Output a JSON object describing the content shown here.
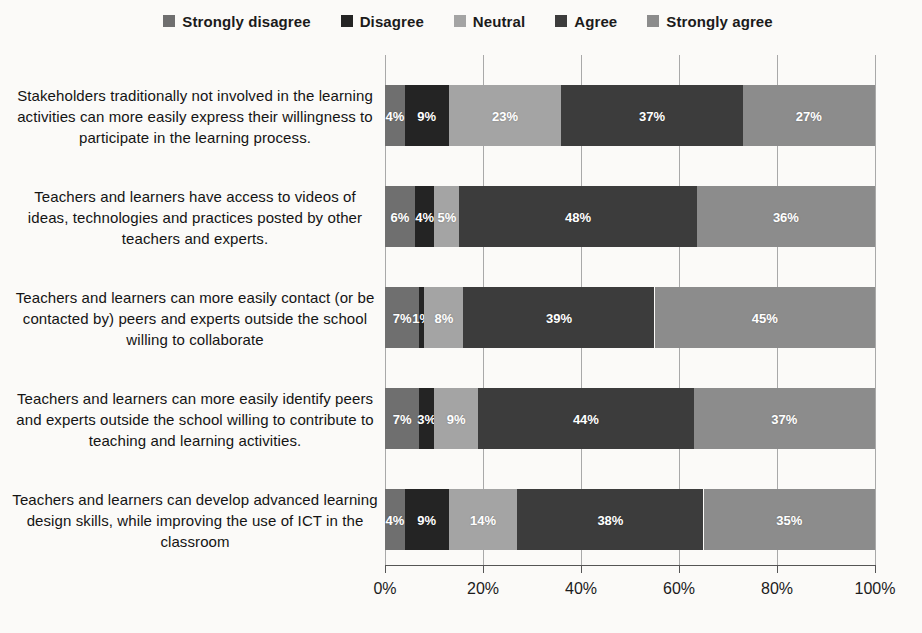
{
  "page": {
    "background": "#fbfaf8"
  },
  "chart_data": {
    "type": "bar",
    "orientation": "horizontal",
    "stacked_percent": true,
    "title": "",
    "legend_position": "top",
    "grid": true,
    "xlim": [
      0,
      100
    ],
    "x_ticks": [
      "0%",
      "20%",
      "40%",
      "60%",
      "80%",
      "100%"
    ],
    "x_tick_values": [
      0,
      20,
      40,
      60,
      80,
      100
    ],
    "categories": [
      "Stakeholders traditionally not involved in the learning activities can more easily express their willingness to participate in the learning process.",
      "Teachers and learners have access to videos of ideas, technologies and practices posted by other teachers and experts.",
      "Teachers and learners can more easily contact (or be contacted by) peers and experts outside the school willing to collaborate",
      "Teachers and learners can more easily identify peers and experts outside the school willing to contribute to teaching and learning activities.",
      "Teachers and learners can develop advanced learning design skills, while improving the use of ICT in the classroom"
    ],
    "series": [
      {
        "name": "Strongly disagree",
        "color": "#6f6f6f",
        "values": [
          4,
          6,
          7,
          7,
          4
        ],
        "labels": [
          "4%",
          "6%",
          "7%",
          "7%",
          "4%"
        ]
      },
      {
        "name": "Disagree",
        "color": "#242424",
        "values": [
          9,
          4,
          1,
          3,
          9
        ],
        "labels": [
          "9%",
          "4%",
          "1%",
          "3%",
          "9%"
        ]
      },
      {
        "name": "Neutral",
        "color": "#a4a4a4",
        "values": [
          23,
          5,
          8,
          9,
          14
        ],
        "labels": [
          "23%",
          "5%",
          "8%",
          "9%",
          "14%"
        ]
      },
      {
        "name": "Agree",
        "color": "#3c3c3c",
        "values": [
          37,
          48,
          39,
          44,
          38
        ],
        "labels": [
          "37%",
          "48%",
          "39%",
          "44%",
          "38%"
        ]
      },
      {
        "name": "Strongly agree",
        "color": "#8c8c8c",
        "values": [
          27,
          36,
          45,
          37,
          35
        ],
        "labels": [
          "27%",
          "36%",
          "45%",
          "37%",
          "35%"
        ]
      }
    ],
    "value_label_color": "#ffffff",
    "axis_color": "#555555",
    "gridline_color": "#a9a9a9"
  }
}
